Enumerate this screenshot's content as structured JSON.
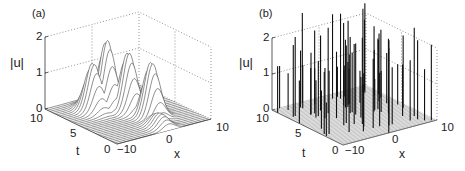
{
  "chart_data": [
    {
      "panel": "(a)",
      "type": "surface3d",
      "title": "",
      "xlabel": "x",
      "ylabel": "t",
      "zlabel": "|u|",
      "xlim": [
        -10,
        10
      ],
      "ylim": [
        0,
        10
      ],
      "zlim": [
        0,
        2
      ],
      "x_ticks": [
        "-10",
        "0",
        "10"
      ],
      "y_ticks": [
        "0",
        "5",
        "10"
      ],
      "z_ticks": [
        "0",
        "1",
        "2"
      ],
      "grid": true,
      "description": "Smooth localized humps near x≈0 whose amplitude oscillates in t",
      "peaks": [
        {
          "x": 2.7,
          "t": 3.5,
          "z": 1.5
        },
        {
          "x": 1.3,
          "t": 5.8,
          "z": 1.6
        },
        {
          "x": -0.8,
          "t": 7.4,
          "z": 1.85
        },
        {
          "x": -3.6,
          "t": 7.5,
          "z": 1.3
        }
      ]
    },
    {
      "panel": "(b)",
      "type": "surface3d",
      "title": "",
      "xlabel": "x",
      "ylabel": "t",
      "zlabel": "|u|",
      "xlim": [
        -10,
        10
      ],
      "ylim": [
        0,
        10
      ],
      "zlim": [
        0,
        2
      ],
      "x_ticks": [
        "-10",
        "0",
        "10"
      ],
      "y_ticks": [
        "0",
        "5",
        "10"
      ],
      "z_ticks": [
        "0",
        "1",
        "2"
      ],
      "grid": true,
      "description": "Many narrow random spikes of height up to ~2.5 over a flat floor",
      "spike_height_range": [
        0.8,
        2.5
      ]
    }
  ],
  "labels": {
    "a": {
      "panel": "(a)",
      "z2": "2",
      "z1": "1",
      "z0": "0",
      "zlabel": "|u|",
      "t10": "10",
      "t5": "5",
      "t0": "0",
      "tlabel": "t",
      "xm10": "−10",
      "x0": "0",
      "x10": "10",
      "xlabel": "x"
    },
    "b": {
      "panel": "(b)",
      "z2": "2",
      "z1": "1",
      "z0": "0",
      "zlabel": "|u|",
      "t10": "10",
      "t5": "5",
      "t0": "0",
      "tlabel": "t",
      "xm10": "−10",
      "x0": "0",
      "x10": "10",
      "xlabel": "x"
    }
  },
  "geometry": {
    "a": {
      "origin": [
        117,
        144
      ],
      "ux": [
        4.7,
        -1.25
      ],
      "ut": [
        -7.2,
        -3.5
      ],
      "uz": -36
    },
    "b": {
      "origin": [
        343,
        145
      ],
      "ux": [
        4.7,
        -1.25
      ],
      "ut": [
        -7.1,
        -3.5
      ],
      "uz": -36
    }
  }
}
